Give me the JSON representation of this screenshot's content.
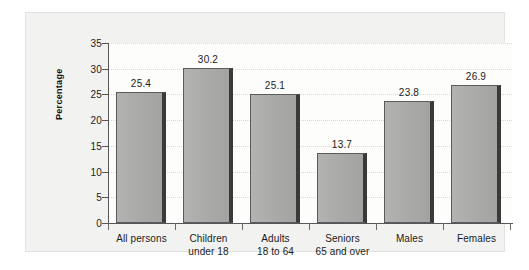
{
  "chart_data": {
    "type": "bar",
    "title": "",
    "subtitle": "",
    "xlabel": "",
    "ylabel": "Percentage",
    "ylim": [
      0,
      35
    ],
    "yticks": [
      0,
      5,
      10,
      15,
      20,
      25,
      30,
      35
    ],
    "ytick_labels": [
      "0",
      "5",
      "10",
      "15",
      "20",
      "25",
      "30",
      "35"
    ],
    "grid": true,
    "legend": null,
    "categories": [
      "All persons",
      "Children under 18",
      "Adults 18 to 64",
      "Seniors 65 and over",
      "Males",
      "Females"
    ],
    "category_lines": [
      [
        "All persons",
        ""
      ],
      [
        "Children",
        "under 18"
      ],
      [
        "Adults",
        "18 to 64"
      ],
      [
        "Seniors",
        "65 and over"
      ],
      [
        "Males",
        ""
      ],
      [
        "Females",
        ""
      ]
    ],
    "values": [
      25.4,
      30.2,
      25.1,
      13.7,
      23.8,
      26.9
    ],
    "value_labels": [
      "25.4",
      "30.2",
      "25.1",
      "13.7",
      "23.8",
      "26.9"
    ],
    "colors": {
      "bar_fill": "#a9a9a7",
      "bar_outline": "#5b5b5b",
      "bar_shadow": "#3a3a3a",
      "axis": "#56565a",
      "gridline": "#d9d9d6",
      "panel_background": "#f2f2f0",
      "plot_background": "#fdfdfc",
      "text": "#1c1c1c"
    }
  }
}
